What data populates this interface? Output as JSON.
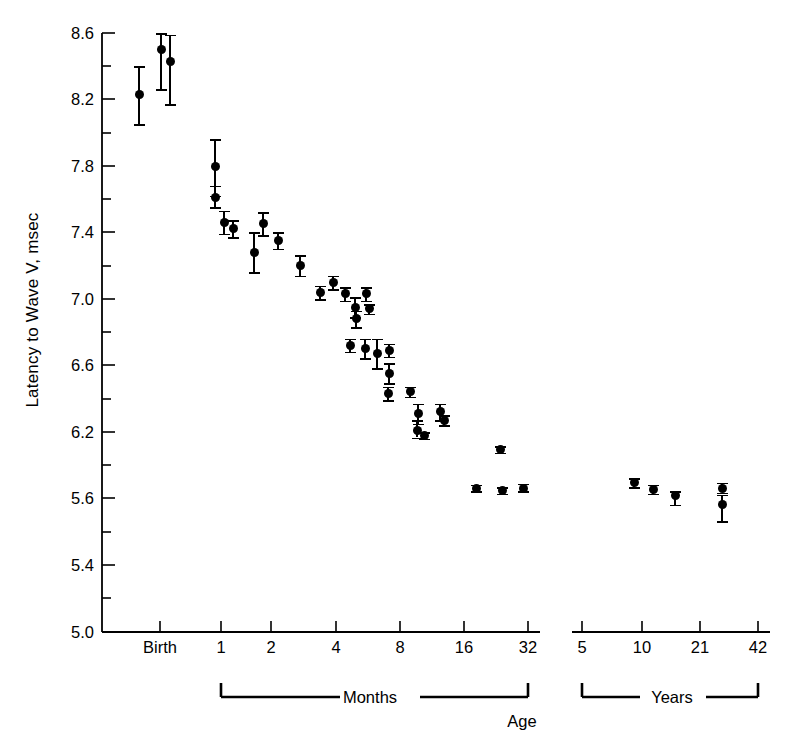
{
  "chart_data": {
    "type": "scatter",
    "title": "",
    "ylabel": "Latency to Wave V, msec",
    "xlabel": "Age",
    "grid": false,
    "legend": "none",
    "ylim": [
      5.0,
      8.6
    ],
    "y_tick_labels": [
      "8.6",
      "8.2",
      "7.8",
      "7.4",
      "7.0",
      "6.6",
      "6.2",
      "5.6",
      "5.4",
      "5.0"
    ],
    "y_minor_ticks": true,
    "x_axis_note": "broken axis: months segment then years segment",
    "x_groups": [
      {
        "name": "Months",
        "tick_labels": [
          "Birth",
          "1",
          "2",
          "4",
          "8",
          "16",
          "32"
        ],
        "bracket_label": "Months"
      },
      {
        "name": "Years",
        "tick_labels": [
          "5",
          "10",
          "21",
          "42"
        ],
        "bracket_label": "Years"
      }
    ],
    "series": [
      {
        "name": "Latency to Wave V",
        "error_bars": "standard deviation",
        "points": [
          {
            "segment": "months",
            "x_label": "Birth",
            "x_px": 139,
            "y": 8.23,
            "err_low": 8.05,
            "err_high": 8.4
          },
          {
            "segment": "months",
            "x_label": "Birth",
            "x_px": 161,
            "y": 8.5,
            "err_low": 8.26,
            "err_high": 8.62
          },
          {
            "segment": "months",
            "x_label": "Birth",
            "x_px": 170,
            "y": 8.43,
            "err_low": 8.17,
            "err_high": 8.59
          },
          {
            "segment": "months",
            "x_label": "~1",
            "x_px": 215,
            "y": 7.8,
            "err_low": 7.62,
            "err_high": 7.96
          },
          {
            "segment": "months",
            "x_label": "1",
            "x_px": 215,
            "y": 7.61,
            "err_low": 7.55,
            "err_high": 7.68
          },
          {
            "segment": "months",
            "x_label": "1",
            "x_px": 224,
            "y": 7.46,
            "err_low": 7.39,
            "err_high": 7.53
          },
          {
            "segment": "months",
            "x_label": "1",
            "x_px": 233,
            "y": 7.42,
            "err_low": 7.37,
            "err_high": 7.47
          },
          {
            "segment": "months",
            "x_label": "1.5",
            "x_px": 254,
            "y": 7.28,
            "err_low": 7.16,
            "err_high": 7.4
          },
          {
            "segment": "months",
            "x_label": "1.5",
            "x_px": 263,
            "y": 7.45,
            "err_low": 7.38,
            "err_high": 7.52
          },
          {
            "segment": "months",
            "x_label": "2",
            "x_px": 278,
            "y": 7.35,
            "err_low": 7.3,
            "err_high": 7.4
          },
          {
            "segment": "months",
            "x_label": "2.5",
            "x_px": 300,
            "y": 7.2,
            "err_low": 7.14,
            "err_high": 7.26
          },
          {
            "segment": "months",
            "x_label": "3",
            "x_px": 320,
            "y": 7.04,
            "err_low": 7.0,
            "err_high": 7.08
          },
          {
            "segment": "months",
            "x_label": "3",
            "x_px": 333,
            "y": 7.1,
            "err_low": 7.06,
            "err_high": 7.14
          },
          {
            "segment": "months",
            "x_label": "3.5",
            "x_px": 345,
            "y": 7.03,
            "err_low": 6.99,
            "err_high": 7.07
          },
          {
            "segment": "months",
            "x_label": "4",
            "x_px": 355,
            "y": 6.95,
            "err_low": 6.89,
            "err_high": 7.01
          },
          {
            "segment": "months",
            "x_label": "4",
            "x_px": 366,
            "y": 7.03,
            "err_low": 6.99,
            "err_high": 7.07
          },
          {
            "segment": "months",
            "x_label": "4.5",
            "x_px": 356,
            "y": 6.88,
            "err_low": 6.83,
            "err_high": 6.93
          },
          {
            "segment": "months",
            "x_label": "5",
            "x_px": 369,
            "y": 6.94,
            "err_low": 6.91,
            "err_high": 6.97
          },
          {
            "segment": "months",
            "x_label": "5",
            "x_px": 350,
            "y": 6.72,
            "err_low": 6.68,
            "err_high": 6.76
          },
          {
            "segment": "months",
            "x_label": "5.5",
            "x_px": 365,
            "y": 6.7,
            "err_low": 6.64,
            "err_high": 6.76
          },
          {
            "segment": "months",
            "x_label": "6",
            "x_px": 377,
            "y": 6.67,
            "err_low": 6.58,
            "err_high": 6.76
          },
          {
            "segment": "months",
            "x_label": "6",
            "x_px": 389,
            "y": 6.69,
            "err_low": 6.65,
            "err_high": 6.73
          },
          {
            "segment": "months",
            "x_label": "7",
            "x_px": 389,
            "y": 6.55,
            "err_low": 6.49,
            "err_high": 6.61
          },
          {
            "segment": "months",
            "x_label": "7",
            "x_px": 388,
            "y": 6.43,
            "err_low": 6.39,
            "err_high": 6.47
          },
          {
            "segment": "months",
            "x_label": "8",
            "x_px": 410,
            "y": 6.44,
            "err_low": 6.41,
            "err_high": 6.47
          },
          {
            "segment": "months",
            "x_label": "9",
            "x_px": 418,
            "y": 6.31,
            "err_low": 6.25,
            "err_high": 6.37
          },
          {
            "segment": "months",
            "x_label": "10",
            "x_px": 440,
            "y": 6.32,
            "err_low": 6.27,
            "err_high": 6.37
          },
          {
            "segment": "months",
            "x_label": "10",
            "x_px": 444,
            "y": 6.27,
            "err_low": 6.24,
            "err_high": 6.3
          },
          {
            "segment": "months",
            "x_label": "11",
            "x_px": 417,
            "y": 6.21,
            "err_low": 6.15,
            "err_high": 6.27
          },
          {
            "segment": "months",
            "x_label": "11",
            "x_px": 424,
            "y": 6.17,
            "err_low": 6.14,
            "err_high": 6.2
          },
          {
            "segment": "months",
            "x_label": "16",
            "x_px": 476,
            "y": 5.69,
            "err_low": 5.66,
            "err_high": 5.72
          },
          {
            "segment": "months",
            "x_label": "24",
            "x_px": 500,
            "y": 6.04,
            "err_low": 6.01,
            "err_high": 6.07
          },
          {
            "segment": "months",
            "x_label": "28",
            "x_px": 502,
            "y": 5.67,
            "err_low": 5.64,
            "err_high": 5.7
          },
          {
            "segment": "months",
            "x_label": "32",
            "x_px": 523,
            "y": 5.69,
            "err_low": 5.66,
            "err_high": 5.73
          },
          {
            "segment": "years",
            "x_label": "8",
            "x_px": 634,
            "y": 5.74,
            "err_low": 5.7,
            "err_high": 5.78
          },
          {
            "segment": "years",
            "x_label": "10",
            "x_px": 653,
            "y": 5.68,
            "err_low": 5.64,
            "err_high": 5.72
          },
          {
            "segment": "years",
            "x_label": "14",
            "x_px": 675,
            "y": 5.62,
            "err_low": 5.58,
            "err_high": 5.66
          },
          {
            "segment": "years",
            "x_label": "24",
            "x_px": 722,
            "y": 5.69,
            "err_low": 5.65,
            "err_high": 5.74
          },
          {
            "segment": "years",
            "x_label": "24",
            "x_px": 722,
            "y": 5.58,
            "err_low": 5.53,
            "err_high": 5.63
          }
        ]
      }
    ]
  },
  "axes": {
    "y": {
      "label": "Latency to Wave V, msec",
      "ticks": [
        {
          "label": "8.6",
          "px": 33,
          "major": true
        },
        {
          "label": "",
          "px": 66,
          "major": false
        },
        {
          "label": "8.2",
          "px": 99,
          "major": true
        },
        {
          "label": "",
          "px": 133,
          "major": false
        },
        {
          "label": "7.8",
          "px": 166,
          "major": true
        },
        {
          "label": "",
          "px": 199,
          "major": false
        },
        {
          "label": "7.4",
          "px": 232,
          "major": true
        },
        {
          "label": "",
          "px": 266,
          "major": false
        },
        {
          "label": "7.0",
          "px": 299,
          "major": true
        },
        {
          "label": "",
          "px": 332,
          "major": false
        },
        {
          "label": "6.6",
          "px": 365,
          "major": true
        },
        {
          "label": "",
          "px": 399,
          "major": false
        },
        {
          "label": "6.2",
          "px": 432,
          "major": true
        },
        {
          "label": "",
          "px": 465,
          "major": false
        },
        {
          "label": "5.6",
          "px": 498,
          "major": true
        },
        {
          "label": "",
          "px": 532,
          "major": false
        },
        {
          "label": "5.4",
          "px": 565,
          "major": true
        },
        {
          "label": "",
          "px": 598,
          "major": false
        },
        {
          "label": "5.0",
          "px": 632,
          "major": true
        }
      ]
    },
    "x": {
      "label": "Age",
      "months_ticks": [
        {
          "label": "Birth",
          "px": 160
        },
        {
          "label": "1",
          "px": 221
        },
        {
          "label": "2",
          "px": 271
        },
        {
          "label": "4",
          "px": 336
        },
        {
          "label": "8",
          "px": 400
        },
        {
          "label": "16",
          "px": 464
        },
        {
          "label": "32",
          "px": 528
        }
      ],
      "years_ticks": [
        {
          "label": "5",
          "px": 582
        },
        {
          "label": "10",
          "px": 642
        },
        {
          "label": "21",
          "px": 700
        },
        {
          "label": "42",
          "px": 758
        }
      ],
      "months_bracket_label": "Months",
      "years_bracket_label": "Years"
    }
  },
  "style": {
    "ink": "#000000",
    "paper": "#ffffff"
  }
}
